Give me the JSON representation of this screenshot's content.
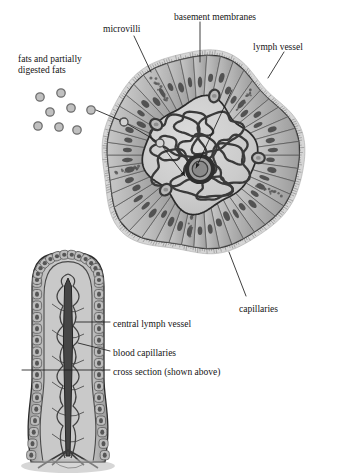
{
  "figure": {
    "title_alt": "Cross section and longitudinal section of an intestinal villus",
    "background": "#ffffff",
    "ink": "#1a1a1a",
    "palette": {
      "cell_fill": "#b3b3b3",
      "cell_fill_light": "#c6c6c6",
      "core_fill": "#c9c9c9",
      "core_fill_light": "#d4d4d4",
      "nucleus": "#4a4a4a",
      "vessel_stroke": "#3a3a3a",
      "lymph_dark": "#2e2e2e",
      "droplet_fill": "#c0c0c0",
      "droplet_stroke": "#6e6e6e",
      "outline": "#2b2b2b"
    }
  },
  "labels": [
    {
      "id": "fats",
      "text": "fats and partially digested fats",
      "x": 18,
      "y": 54,
      "size": 9.5,
      "align": "left",
      "width": 96
    },
    {
      "id": "microvilli",
      "text": "microvilli",
      "x": 103,
      "y": 24,
      "size": 9.5,
      "align": "left",
      "width": 0
    },
    {
      "id": "basement",
      "text": "basement membranes",
      "x": 174,
      "y": 12,
      "size": 9.5,
      "align": "left",
      "width": 0
    },
    {
      "id": "lymph-vessel",
      "text": "lymph vessel",
      "x": 253,
      "y": 42,
      "size": 9.5,
      "align": "left",
      "width": 0
    },
    {
      "id": "capillaries",
      "text": "capillaries",
      "x": 239,
      "y": 304,
      "size": 9.5,
      "align": "left",
      "width": 0
    },
    {
      "id": "central-lymph",
      "text": "central lymph vessel",
      "x": 113,
      "y": 319,
      "size": 9.5,
      "align": "left",
      "width": 0
    },
    {
      "id": "blood-caps",
      "text": "blood capillaries",
      "x": 113,
      "y": 348,
      "size": 9.5,
      "align": "left",
      "width": 0
    },
    {
      "id": "cross-section",
      "text": "cross section (shown above)",
      "x": 113,
      "y": 367,
      "size": 9.5,
      "align": "left",
      "width": 0
    }
  ],
  "leaders": [
    {
      "id": "microvilli-leader",
      "points": "134,36 151,72"
    },
    {
      "id": "basement-leader",
      "points": "200,22 200,62"
    },
    {
      "id": "lymph-vessel-leader",
      "points": "284,52 268,78"
    },
    {
      "id": "lymph-inner-leader",
      "points": "232,90 196,168"
    },
    {
      "id": "capillaries-leader",
      "points": "246,296 229,252"
    },
    {
      "id": "central-lymph-leader",
      "points": "110,322 76,322"
    },
    {
      "id": "blood-caps-leader",
      "points": "110,351 78,343"
    },
    {
      "id": "cross-section-leader",
      "points": "110,370 22,370"
    },
    {
      "id": "fat-uptake-leader-1",
      "points": "96,110 124,122"
    },
    {
      "id": "fat-uptake-leader-2",
      "points": "124,122 160,143"
    },
    {
      "id": "fat-uptake-leader-3",
      "points": "160,143 185,176"
    }
  ],
  "fat_droplets": [
    {
      "cx": 40,
      "cy": 97,
      "r": 4.2
    },
    {
      "cx": 61,
      "cy": 93,
      "r": 4.2
    },
    {
      "cx": 50,
      "cy": 112,
      "r": 4.2
    },
    {
      "cx": 71,
      "cy": 108,
      "r": 4.2
    },
    {
      "cx": 38,
      "cy": 126,
      "r": 4.2
    },
    {
      "cx": 59,
      "cy": 127,
      "r": 4.2
    },
    {
      "cx": 91,
      "cy": 110,
      "r": 4.2
    },
    {
      "cx": 77,
      "cy": 130,
      "r": 4.2
    }
  ],
  "cross_section": {
    "center_x": 200,
    "center_y": 155,
    "outer_radius": 96,
    "core_radius": 54,
    "lacteal_radius": 13,
    "cell_count": 46,
    "note": "radial columnar epithelial cells with oval nuclei; brush border fringe outside"
  },
  "villus": {
    "center_x": 68,
    "top_y": 252,
    "bottom_y": 462,
    "half_width": 37,
    "note": "finger-like villus with columnar epithelium, capillary loops and central lacteal"
  }
}
